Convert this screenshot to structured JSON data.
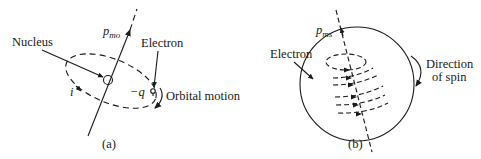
{
  "figure": {
    "panel_a": {
      "caption": "(a)",
      "moment_symbol": "p",
      "moment_subscript": "mo",
      "nucleus_label": "Nucleus",
      "electron_label": "Electron",
      "charge_label": "−q",
      "current_label": "i",
      "motion_label": "Orbital motion"
    },
    "panel_b": {
      "caption": "(b)",
      "moment_symbol": "p",
      "moment_subscript": "ms",
      "electron_label": "Electron",
      "spin_label_line1": "Direction",
      "spin_label_line2": "of spin"
    }
  }
}
